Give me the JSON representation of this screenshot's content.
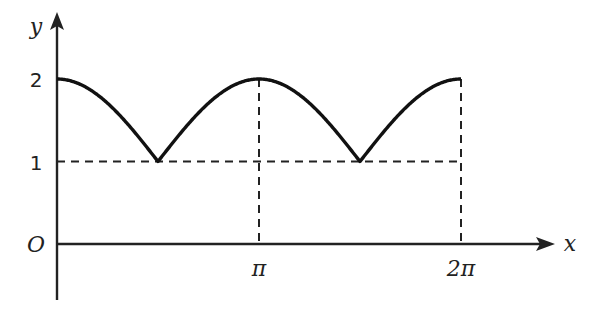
{
  "chart_data": {
    "type": "line",
    "title": "",
    "function": "y = 1 + |cos x|",
    "xlabel": "x",
    "ylabel": "y",
    "origin_label": "O",
    "x_ticks": [
      {
        "value": 3.14159,
        "label": "π"
      },
      {
        "value": 6.28318,
        "label": "2π"
      }
    ],
    "y_ticks": [
      {
        "value": 1,
        "label": "1"
      },
      {
        "value": 2,
        "label": "2"
      }
    ],
    "xlim": [
      0,
      6.28318
    ],
    "ylim": [
      0,
      2
    ],
    "key_points": [
      {
        "x": 0,
        "y": 2
      },
      {
        "x": 1.5708,
        "y": 1
      },
      {
        "x": 3.14159,
        "y": 2
      },
      {
        "x": 4.71239,
        "y": 1
      },
      {
        "x": 6.28318,
        "y": 2
      }
    ],
    "dashed_guides": [
      "y = 1 horizontal line",
      "x = π vertical line",
      "x = 2π vertical line"
    ],
    "grid": false,
    "legend": false
  }
}
